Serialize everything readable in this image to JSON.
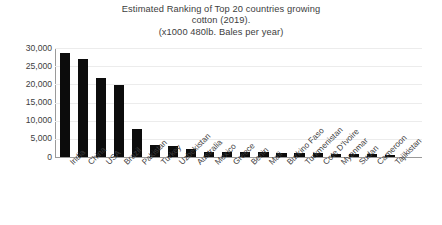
{
  "chart_data": {
    "type": "bar",
    "title": "Estimated Ranking of Top 20 countries growing cotton (2019). (x1000 480lb. Bales per year)",
    "title_lines": [
      "Estimated Ranking of Top 20 countries growing",
      "cotton (2019).",
      "(x1000 480lb. Bales per year)"
    ],
    "xlabel": "",
    "ylabel": "",
    "ylim": [
      0,
      30000
    ],
    "ytick_labels": [
      "30,000",
      "25,000",
      "20,000",
      "15,000",
      "10,000",
      "5,000",
      "0"
    ],
    "ytick_values": [
      30000,
      25000,
      20000,
      15000,
      10000,
      5000,
      0
    ],
    "grid": true,
    "legend": false,
    "bar_color": "#0c0c0c",
    "categories": [
      "India",
      "China",
      "USA",
      "Brazil",
      "Pakistan",
      "Turkey",
      "Uzbekistan",
      "Australia",
      "Mexico",
      "Greece",
      "Benin",
      "Mali",
      "Burkino Faso",
      "Turkmenistan",
      "Cote D'Ivoire",
      "Myanmar",
      "Sudan",
      "Cameroon",
      "Tajikistan"
    ],
    "values": [
      28500,
      27000,
      21800,
      19700,
      7700,
      3400,
      2900,
      2200,
      1500,
      1300,
      1300,
      1300,
      1200,
      1200,
      1100,
      900,
      900,
      800,
      500
    ]
  }
}
